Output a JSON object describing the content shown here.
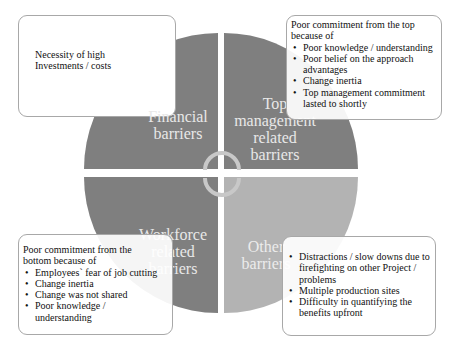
{
  "diagram": {
    "type": "four-quadrant cycle diagram",
    "colors": {
      "quadrant_dark": "#7f7f7f",
      "quadrant_light": "#b3b3b3",
      "quadrant_text": "#e8e8e8",
      "box_border": "#a8a8a8",
      "arrow": "#c8c8c8"
    },
    "quadrants": {
      "financial": {
        "label": "Financial barriers"
      },
      "top_management": {
        "label_lines": [
          "Top",
          "management",
          "related",
          "barriers"
        ]
      },
      "workforce": {
        "label_lines": [
          "Workforce",
          "related",
          "barriers"
        ]
      },
      "other": {
        "label_lines": [
          "Other",
          "barriers"
        ]
      }
    },
    "financial_label_lines": [
      "Financial",
      "barriers"
    ],
    "boxes": {
      "financial": {
        "lines": [
          "Necessity of high",
          "Investments / costs"
        ]
      },
      "top_management": {
        "intro": "Poor commitment from the top because of",
        "bullets": [
          "Poor knowledge / understanding",
          "Poor belief on the approach advantages",
          "Change inertia",
          "Top management commitment lasted to shortly"
        ]
      },
      "workforce": {
        "intro": "Poor commitment from the bottom because of",
        "bullets": [
          "Employees` fear of job cutting",
          "Change inertia",
          "Change was not shared",
          "Poor knowledge / understanding"
        ]
      },
      "other": {
        "bullets": [
          "Distractions / slow downs due to firefighting on other Project / problems",
          "Multiple production sites",
          "Difficulty in quantifying the benefits upfront"
        ]
      }
    },
    "center_icon": "cycle-arrows-icon"
  }
}
